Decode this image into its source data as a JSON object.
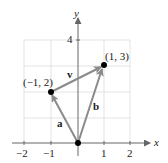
{
  "diagram": {
    "type": "vector-plot",
    "axes": {
      "x_label": "x",
      "y_label": "y"
    },
    "x_ticks": [
      "−2",
      "−1",
      "1",
      "2"
    ],
    "y_ticks": [
      "4"
    ],
    "points": [
      {
        "label": "(−1, 2)",
        "x": -1,
        "y": 2
      },
      {
        "label": "(1, 3)",
        "x": 1,
        "y": 3
      }
    ],
    "vectors": [
      {
        "name": "a",
        "from": [
          0,
          0
        ],
        "to": [
          -1,
          2
        ]
      },
      {
        "name": "b",
        "from": [
          0,
          0
        ],
        "to": [
          1,
          3
        ]
      },
      {
        "name": "v",
        "from": [
          -1,
          2
        ],
        "to": [
          1,
          3
        ]
      }
    ],
    "colors": {
      "vector": "#8a8a8a",
      "axis": "#777777",
      "grid": "#dddddd",
      "point": "#000000"
    }
  }
}
